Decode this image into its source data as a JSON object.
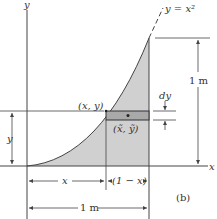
{
  "figure": {
    "label": "(b)",
    "curve_label": "y = x²",
    "axes": {
      "x_label": "x",
      "y_label": "y"
    },
    "point_label": "(x, y)",
    "centroid_label": "(x̃, ỹ)",
    "element_height_label": "dy",
    "height_dimension_label": "1 m",
    "width_dimension_label": "1 m",
    "x_dimension_label": "x",
    "remaining_dimension_label": "(1 − x)",
    "y_dimension_label": "y",
    "colors": {
      "shaded_area": "#d0d0d0",
      "element_strip": "#a9a9a9",
      "lines": "#444444"
    }
  }
}
